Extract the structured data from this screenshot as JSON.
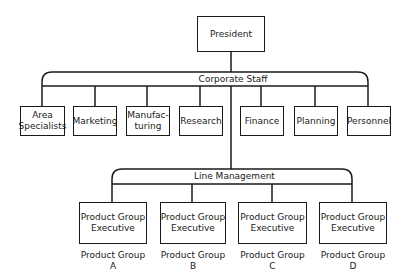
{
  "chart": {
    "top": {
      "label": "President"
    },
    "corporate_staff": {
      "label": "Corporate Staff",
      "units": [
        {
          "lines": [
            "Area",
            "Specialists"
          ]
        },
        {
          "lines": [
            "Marketing"
          ]
        },
        {
          "lines": [
            "Manufac-",
            "turing"
          ]
        },
        {
          "lines": [
            "Research"
          ]
        },
        {
          "lines": [
            "Finance"
          ]
        },
        {
          "lines": [
            "Planning"
          ]
        },
        {
          "lines": [
            "Personnel"
          ]
        }
      ]
    },
    "line_management": {
      "label": "Line Management",
      "executives": [
        {
          "lines": [
            "Product Group",
            "Executive"
          ],
          "group": [
            "Product Group",
            "A"
          ]
        },
        {
          "lines": [
            "Product Group",
            "Executive"
          ],
          "group": [
            "Product Group",
            "B"
          ]
        },
        {
          "lines": [
            "Product Group",
            "Executive"
          ],
          "group": [
            "Product Group",
            "C"
          ]
        },
        {
          "lines": [
            "Product Group",
            "Executive"
          ],
          "group": [
            "Product Group",
            "D"
          ]
        }
      ]
    }
  },
  "colors": {
    "line": "#1a1a1a",
    "background": "#ffffff"
  }
}
